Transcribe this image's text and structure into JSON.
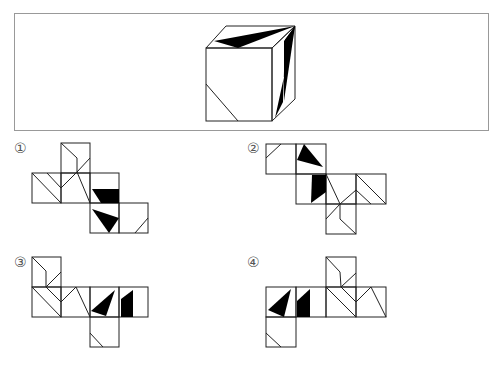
{
  "question_box": {
    "description": "3D cube with patterned faces"
  },
  "options": [
    {
      "label": "①",
      "id": 1
    },
    {
      "label": "②",
      "id": 2
    },
    {
      "label": "③",
      "id": 3
    },
    {
      "label": "④",
      "id": 4
    }
  ],
  "colors": {
    "stroke": "#222222",
    "fill": "#000000",
    "frame": "#999999"
  }
}
